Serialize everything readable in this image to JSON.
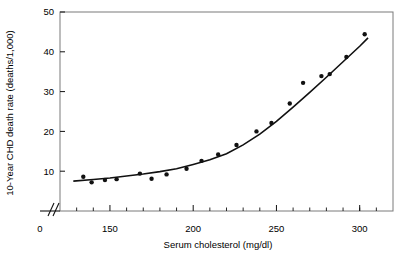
{
  "chart_data": {
    "type": "scatter",
    "title": "",
    "xlabel": "Serum cholesterol (mg/dl)",
    "ylabel": "10-Year CHD death rate (deaths/1,000)",
    "xlim": [
      120,
      320
    ],
    "ylim": [
      0,
      50
    ],
    "grid": false,
    "legend": null,
    "x_axis_break": true,
    "x_break_label": "0",
    "xticks": [
      150,
      200,
      250,
      300
    ],
    "xtick_labels": [
      "150",
      "200",
      "250",
      "300"
    ],
    "x_minor_ticks": [
      130,
      140,
      160,
      170,
      180,
      190,
      210,
      220,
      230,
      240,
      260,
      270,
      280,
      290,
      300,
      310
    ],
    "yticks": [
      10,
      20,
      30,
      40,
      50
    ],
    "ytick_labels": [
      "10",
      "20",
      "30",
      "40",
      "50"
    ],
    "points": [
      {
        "x": 134,
        "y": 8.6
      },
      {
        "x": 139,
        "y": 7.2
      },
      {
        "x": 147,
        "y": 7.8
      },
      {
        "x": 154,
        "y": 8.0
      },
      {
        "x": 168,
        "y": 9.4
      },
      {
        "x": 175,
        "y": 8.1
      },
      {
        "x": 184,
        "y": 9.2
      },
      {
        "x": 196,
        "y": 10.6
      },
      {
        "x": 205,
        "y": 12.6
      },
      {
        "x": 215,
        "y": 14.2
      },
      {
        "x": 226,
        "y": 16.6
      },
      {
        "x": 238,
        "y": 20.0
      },
      {
        "x": 247,
        "y": 22.1
      },
      {
        "x": 258,
        "y": 27.0
      },
      {
        "x": 266,
        "y": 32.2
      },
      {
        "x": 277,
        "y": 33.9
      },
      {
        "x": 282,
        "y": 34.4
      },
      {
        "x": 292,
        "y": 38.7
      },
      {
        "x": 303,
        "y": 44.4
      }
    ],
    "fit_curve": [
      {
        "x": 128,
        "y": 7.5
      },
      {
        "x": 140,
        "y": 7.9
      },
      {
        "x": 150,
        "y": 8.3
      },
      {
        "x": 160,
        "y": 8.8
      },
      {
        "x": 170,
        "y": 9.3
      },
      {
        "x": 180,
        "y": 9.9
      },
      {
        "x": 190,
        "y": 10.6
      },
      {
        "x": 200,
        "y": 11.7
      },
      {
        "x": 210,
        "y": 12.9
      },
      {
        "x": 220,
        "y": 14.4
      },
      {
        "x": 230,
        "y": 16.6
      },
      {
        "x": 240,
        "y": 19.3
      },
      {
        "x": 250,
        "y": 22.5
      },
      {
        "x": 260,
        "y": 26.1
      },
      {
        "x": 270,
        "y": 29.8
      },
      {
        "x": 280,
        "y": 33.6
      },
      {
        "x": 290,
        "y": 37.5
      },
      {
        "x": 300,
        "y": 41.4
      },
      {
        "x": 305,
        "y": 43.5
      }
    ],
    "marker_color": "#111111",
    "curve_color": "#111111",
    "frame_color": "#7a7a7a"
  }
}
